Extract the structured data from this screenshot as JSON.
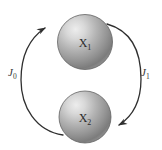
{
  "figure": {
    "background_color": "#ffffff",
    "nodes": [
      {
        "id": "node-top",
        "label": "X",
        "subscript": "1",
        "full_label": "X1",
        "cx": 85,
        "cy": 42,
        "r": 27.5,
        "fill_light": "#e2e2e2",
        "fill_mid": "#a9a9a9",
        "fill_dark": "#6f6f6f",
        "stroke": "#5d5d5d"
      },
      {
        "id": "node-bottom",
        "label": "X",
        "subscript": "2",
        "full_label": "X2",
        "cx": 85,
        "cy": 117,
        "r": 26,
        "fill_light": "#e2e2e2",
        "fill_mid": "#a9a9a9",
        "fill_dark": "#6f6f6f",
        "stroke": "#5d5d5d"
      }
    ],
    "arrows": [
      {
        "id": "arrow-left",
        "label": "J",
        "subscript": "0",
        "full_label": "J0",
        "from": "node-bottom",
        "to": "node-top",
        "direction": "counterclockwise-upward",
        "stroke": "#2f2f2f",
        "stroke_width": 1.3,
        "label_x": 13,
        "label_y": 76
      },
      {
        "id": "arrow-right",
        "label": "J",
        "subscript": "1",
        "full_label": "J1",
        "from": "node-top",
        "to": "node-bottom",
        "direction": "clockwise-downward",
        "stroke": "#2f2f2f",
        "stroke_width": 1.3,
        "label_x": 143,
        "label_y": 76
      }
    ]
  }
}
